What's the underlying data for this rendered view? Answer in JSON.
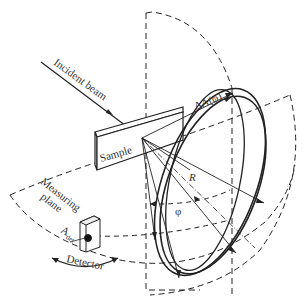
{
  "diagram": {
    "type": "scattering-geometry",
    "labels": {
      "incident_beam": "Incident beam",
      "sample": "Sample",
      "measuring_plane_line1": "Measuring",
      "measuring_plane_line2": "plane",
      "detector": "Detector",
      "a_det_main": "A",
      "a_det_sub": "det",
      "delta_a": "ΔA(φ)",
      "radius": "R",
      "angle": "φ"
    },
    "colors": {
      "line": "#222222",
      "text": "#333333",
      "background": "#ffffff"
    }
  }
}
